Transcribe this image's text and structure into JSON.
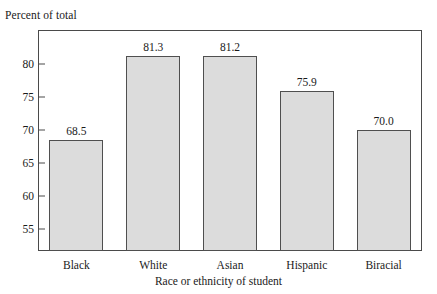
{
  "chart_data": {
    "type": "bar",
    "title": "",
    "subtitle": "",
    "xlabel": "Race or ethnicity of student",
    "ylabel": "Percent of total",
    "categories": [
      "Black",
      "White",
      "Asian",
      "Hispanic",
      "Biracial"
    ],
    "values": [
      68.5,
      81.3,
      81.2,
      75.9,
      70.0
    ],
    "value_labels": [
      "68.5",
      "81.3",
      "81.2",
      "75.9",
      "70.0"
    ],
    "yticks": [
      55,
      60,
      65,
      70,
      75,
      80
    ],
    "ytick_labels": [
      "55",
      "60",
      "65",
      "70",
      "75",
      "80"
    ],
    "ylim": [
      51.6,
      85.2
    ],
    "grid": false,
    "legend": null,
    "bar_fill_color": "#dcdcdc",
    "bar_border_color": "#4f4f4f",
    "frame_color": "#4a4a4a",
    "text_color": "#1a1a1a"
  },
  "axes": {
    "y_caption": "Percent of total",
    "x_title": "Race or ethnicity of student"
  }
}
